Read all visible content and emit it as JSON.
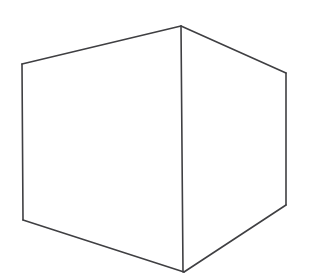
{
  "document": {
    "title": "Cube Line Drawing",
    "kind": "line-drawing",
    "subject": "cube",
    "description": "Hand-drawn outline of a cube seen from a front-on corner view, showing three visible faces: left face, right face and top face meeting at a central vertical edge.",
    "canvas": {
      "width": 318,
      "height": 279,
      "background_color": "#ffffff"
    },
    "stroke": {
      "color": "#3f3f42",
      "width": 1.6,
      "style": "solid",
      "linecap": "round"
    },
    "text_labels": [],
    "geometry": {
      "vertices": {
        "top_apex": {
          "name": "top-apex",
          "x": 181,
          "y": 26
        },
        "top_left": {
          "name": "top-left",
          "x": 22,
          "y": 64
        },
        "top_right": {
          "name": "top-right",
          "x": 286,
          "y": 73
        },
        "bottom_left": {
          "name": "bottom-left",
          "x": 23,
          "y": 220
        },
        "bottom_right": {
          "name": "bottom-right",
          "x": 286,
          "y": 205
        },
        "bottom_apex": {
          "name": "bottom-apex",
          "x": 184,
          "y": 272
        }
      },
      "edges": [
        {
          "name": "top-left-edge",
          "points": "22,64 181,26"
        },
        {
          "name": "top-right-edge",
          "points": "181,26 286,73"
        },
        {
          "name": "left-vertical-edge",
          "points": "22,64 23,220"
        },
        {
          "name": "center-vertical-edge",
          "points": "181,26 183,272"
        },
        {
          "name": "right-vertical-edge",
          "points": "286,73 286,205"
        },
        {
          "name": "bottom-left-edge",
          "points": "23,220 184,272"
        },
        {
          "name": "bottom-right-edge",
          "points": "184,272 286,205"
        }
      ],
      "faces": [
        {
          "name": "left-face",
          "points": "22,64 181,26 183,272 23,220"
        },
        {
          "name": "right-face",
          "points": "181,26 286,73 286,205 183,272"
        }
      ],
      "outline": "22,64 181,26 286,73 286,205 184,272 23,220"
    }
  }
}
